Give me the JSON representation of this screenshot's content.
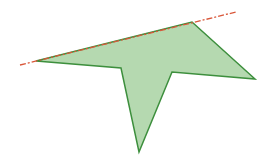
{
  "figure": {
    "width": 262,
    "height": 164,
    "background": "#ffffff",
    "polygon": {
      "points": [
        [
          36,
          61
        ],
        [
          121,
          68
        ],
        [
          139,
          152
        ],
        [
          172,
          72
        ],
        [
          255,
          79
        ],
        [
          192,
          22
        ]
      ],
      "fill": "#b5d9b0",
      "stroke": "#3d8f3d",
      "stroke_width": 1.5
    },
    "dashed_line": {
      "x1": 20,
      "y1": 65,
      "x2": 236,
      "y2": 12,
      "color": "#d9573a",
      "dasharray": "6,2,2,2",
      "stroke_width": 1.3
    }
  }
}
